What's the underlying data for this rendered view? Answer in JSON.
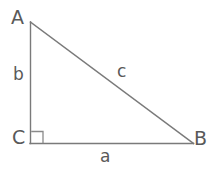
{
  "figure": {
    "kind": "right-triangle-diagram",
    "background_color": "#ffffff",
    "stroke_color": "#7a7a7a",
    "text_color": "#595959",
    "vertices": [
      {
        "name": "A",
        "label": "A",
        "x": 30,
        "y": 22
      },
      {
        "name": "C",
        "label": "C",
        "x": 30,
        "y": 143
      },
      {
        "name": "B",
        "label": "B",
        "x": 193,
        "y": 143
      }
    ],
    "sides": [
      {
        "name": "a",
        "label": "a",
        "from": "C",
        "to": "B",
        "role": "base-horizontal"
      },
      {
        "name": "b",
        "label": "b",
        "from": "C",
        "to": "A",
        "role": "vertical-leg"
      },
      {
        "name": "c",
        "label": "c",
        "from": "A",
        "to": "B",
        "role": "hypotenuse"
      }
    ],
    "right_angle": {
      "at_vertex": "C",
      "marker": "square",
      "size": 12
    }
  }
}
